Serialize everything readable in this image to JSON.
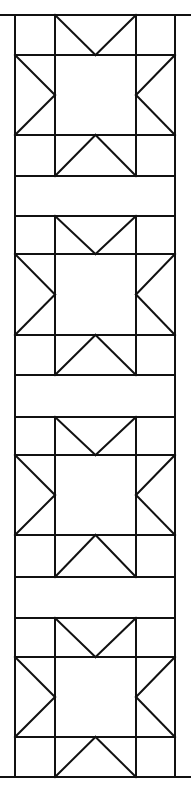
{
  "diagram": {
    "title": "",
    "type": "quilt-pattern",
    "stroke_color": "#111111",
    "background": "#ffffff",
    "columns_x": [
      15,
      55,
      136,
      175
    ],
    "blocks": [
      {
        "rows_y": [
          15,
          55,
          135,
          176
        ]
      },
      {
        "rows_y": [
          216,
          254,
          335,
          375
        ]
      },
      {
        "rows_y": [
          417,
          455,
          535,
          577
        ]
      },
      {
        "rows_y": [
          618,
          657,
          737,
          777
        ]
      }
    ],
    "sashing": [
      {
        "y1": 176,
        "y2": 216
      },
      {
        "y1": 375,
        "y2": 417
      },
      {
        "y1": 577,
        "y2": 618
      }
    ]
  }
}
